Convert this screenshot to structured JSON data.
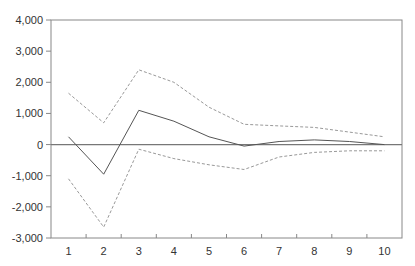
{
  "chart_data": {
    "type": "line",
    "title": "",
    "xlabel": "",
    "ylabel": "",
    "x": [
      1,
      2,
      3,
      4,
      5,
      6,
      7,
      8,
      9,
      10
    ],
    "ylim": [
      -3000,
      4000
    ],
    "yticks": [
      4000,
      3000,
      2000,
      1000,
      0,
      -1000,
      -2000,
      -3000
    ],
    "ytick_labels": [
      "4,000",
      "3,000",
      "2,000",
      "1,000",
      "0",
      "-1,000",
      "-2,000",
      "-3,000"
    ],
    "xtick_labels": [
      "1",
      "2",
      "3",
      "4",
      "5",
      "6",
      "7",
      "8",
      "9",
      "10"
    ],
    "grid": false,
    "legend": null,
    "zero_line": true,
    "series": [
      {
        "name": "response",
        "style": "solid",
        "color": "#555555",
        "values": [
          250,
          -950,
          1100,
          750,
          250,
          -50,
          100,
          150,
          100,
          0
        ]
      },
      {
        "name": "upper band",
        "style": "dashed",
        "color": "#999999",
        "values": [
          1650,
          700,
          2400,
          2000,
          1200,
          650,
          600,
          550,
          400,
          250
        ]
      },
      {
        "name": "lower band",
        "style": "dashed",
        "color": "#999999",
        "values": [
          -1100,
          -2650,
          -150,
          -450,
          -650,
          -800,
          -400,
          -250,
          -200,
          -200
        ]
      }
    ]
  },
  "colors": {
    "axis": "#888888",
    "zero_line": "#777777"
  }
}
